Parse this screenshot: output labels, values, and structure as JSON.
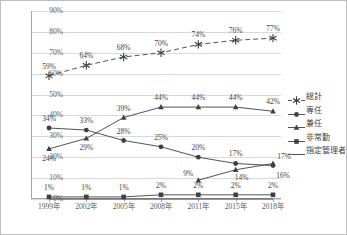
{
  "chart_data": {
    "type": "line",
    "title": "",
    "xlabel": "",
    "ylabel": "",
    "ylim": [
      0,
      90
    ],
    "ytick_labels": [
      "0%",
      "10%",
      "20%",
      "30%",
      "40%",
      "50%",
      "60%",
      "70%",
      "80%",
      "90%"
    ],
    "yticks": [
      0,
      10,
      20,
      30,
      40,
      50,
      60,
      70,
      80,
      90
    ],
    "grid": true,
    "legend_position": "right",
    "categories": [
      "1999年",
      "2002年",
      "2005年",
      "2008年",
      "2011年",
      "2015年",
      "2018年"
    ],
    "series": [
      {
        "name": "総計",
        "marker": "star",
        "line": "dashed",
        "values": [
          59,
          64,
          68,
          70,
          74,
          76,
          77
        ],
        "labels": [
          "59%",
          "64%",
          "68%",
          "70%",
          "74%",
          "76%",
          "77%"
        ]
      },
      {
        "name": "専任",
        "marker": "circle",
        "line": "solid",
        "values": [
          34,
          33,
          28,
          25,
          20,
          17,
          16
        ],
        "labels": [
          "34%",
          "33%",
          "28%",
          "25%",
          "20%",
          "17%",
          "16%"
        ]
      },
      {
        "name": "兼任",
        "marker": "triangle",
        "line": "solid",
        "values": [
          24,
          29,
          39,
          44,
          44,
          44,
          42
        ],
        "labels": [
          "24%",
          "29%",
          "39%",
          "44%",
          "44%",
          "44%",
          "42%"
        ]
      },
      {
        "name": "非常勤",
        "marker": "square",
        "line": "solid",
        "values": [
          1,
          1,
          1,
          2,
          2,
          2,
          2
        ],
        "labels": [
          "1%",
          "1%",
          "1%",
          "2%",
          "2%",
          "2%",
          "2%"
        ]
      },
      {
        "name": "指定管理者",
        "marker": "none",
        "line": "solid",
        "values": [
          0,
          0,
          0,
          0,
          0,
          0,
          0
        ],
        "labels": [
          "",
          "",
          "",
          "",
          "",
          "",
          ""
        ]
      }
    ],
    "extra_series": [
      {
        "name": "兼任-late",
        "values": [
          null,
          null,
          null,
          null,
          9,
          14,
          17
        ],
        "labels": [
          "",
          "",
          "",
          "",
          "9%",
          "14%",
          "17%"
        ]
      }
    ],
    "colors": {
      "line": "#404040",
      "grid": "#d9d9d9",
      "axis": "#a6a6a6",
      "text": "#3f3f3f",
      "background": "#ffffff"
    }
  },
  "legend": {
    "items": [
      {
        "label": "総計"
      },
      {
        "label": "専任"
      },
      {
        "label": "兼任"
      },
      {
        "label": "非常勤"
      },
      {
        "label": "指定管理者"
      }
    ]
  }
}
